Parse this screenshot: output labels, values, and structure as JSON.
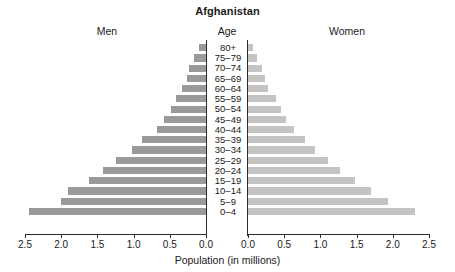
{
  "chart": {
    "title": "Afghanistan",
    "left_panel_header": "Men",
    "center_header": "Age",
    "right_panel_header": "Women",
    "xlabel": "Population (in millions)"
  },
  "colors": {
    "men_bar": "#9a9a9a",
    "women_bar": "#c4c4c4",
    "axis": "#2b2b2b",
    "background": "#ffffff",
    "text": "#1a1a1a"
  },
  "axis": {
    "left_ticks": [
      "2.5",
      "2.0",
      "1.5",
      "1.0",
      "0.5",
      "0.0"
    ],
    "right_ticks": [
      "0.0",
      "0.5",
      "1.0",
      "1.5",
      "2.0",
      "2.5"
    ],
    "max": 2.5,
    "min": 0.0,
    "step": 0.5
  },
  "chart_data": {
    "type": "bar",
    "subtype": "population-pyramid",
    "title": "Afghanistan",
    "xlabel": "Population (in millions)",
    "ylabel": "Age",
    "xlim": [
      0,
      2.5
    ],
    "grid": false,
    "legend_position": "none",
    "categories": [
      "80+",
      "75-79",
      "70-74",
      "65-69",
      "60-64",
      "55-59",
      "50-54",
      "45-49",
      "40-44",
      "35-39",
      "30-34",
      "25-29",
      "20-24",
      "15-19",
      "10-14",
      "5-9",
      "0-4"
    ],
    "series": [
      {
        "name": "Men",
        "side": "left",
        "color": "#9a9a9a",
        "values": [
          0.09,
          0.16,
          0.23,
          0.26,
          0.33,
          0.42,
          0.48,
          0.58,
          0.68,
          0.88,
          1.02,
          1.24,
          1.42,
          1.62,
          1.9,
          2.0,
          2.45
        ]
      },
      {
        "name": "Women",
        "side": "right",
        "color": "#c4c4c4",
        "values": [
          0.07,
          0.13,
          0.2,
          0.23,
          0.28,
          0.38,
          0.45,
          0.53,
          0.63,
          0.79,
          0.92,
          1.1,
          1.27,
          1.48,
          1.7,
          1.94,
          2.31
        ]
      }
    ]
  }
}
